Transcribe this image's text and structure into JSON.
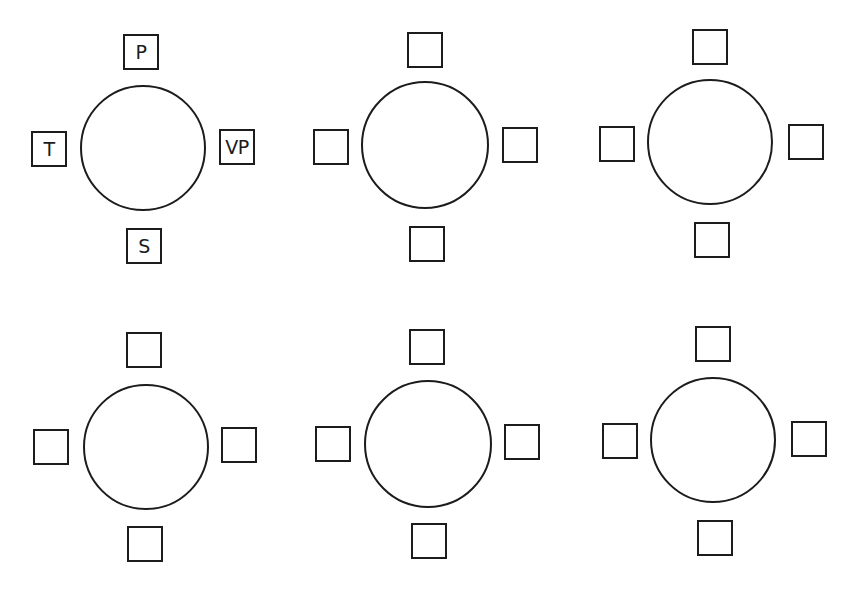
{
  "diagram": {
    "colors": {
      "stroke": "#1c1c1c",
      "background": "#ffffff"
    },
    "tables": [
      {
        "id": 1,
        "cx": 143,
        "cy": 148,
        "r": 63,
        "seats": {
          "top": {
            "label": "P",
            "x": 123,
            "y": 34
          },
          "left": {
            "label": "T",
            "x": 31,
            "y": 131
          },
          "right": {
            "label": "VP",
            "x": 219,
            "y": 129
          },
          "bottom": {
            "label": "S",
            "x": 126,
            "y": 228
          }
        }
      },
      {
        "id": 2,
        "cx": 425,
        "cy": 145,
        "r": 64,
        "seats": {
          "top": {
            "label": "",
            "x": 407,
            "y": 32
          },
          "left": {
            "label": "",
            "x": 313,
            "y": 129
          },
          "right": {
            "label": "",
            "x": 502,
            "y": 127
          },
          "bottom": {
            "label": "",
            "x": 409,
            "y": 226
          }
        }
      },
      {
        "id": 3,
        "cx": 710,
        "cy": 142,
        "r": 63,
        "seats": {
          "top": {
            "label": "",
            "x": 692,
            "y": 29
          },
          "left": {
            "label": "",
            "x": 599,
            "y": 126
          },
          "right": {
            "label": "",
            "x": 788,
            "y": 124
          },
          "bottom": {
            "label": "",
            "x": 694,
            "y": 222
          }
        }
      },
      {
        "id": 4,
        "cx": 146,
        "cy": 447,
        "r": 63,
        "seats": {
          "top": {
            "label": "",
            "x": 126,
            "y": 332
          },
          "left": {
            "label": "",
            "x": 33,
            "y": 429
          },
          "right": {
            "label": "",
            "x": 221,
            "y": 427
          },
          "bottom": {
            "label": "",
            "x": 127,
            "y": 526
          }
        }
      },
      {
        "id": 5,
        "cx": 428,
        "cy": 444,
        "r": 64,
        "seats": {
          "top": {
            "label": "",
            "x": 409,
            "y": 329
          },
          "left": {
            "label": "",
            "x": 315,
            "y": 426
          },
          "right": {
            "label": "",
            "x": 504,
            "y": 424
          },
          "bottom": {
            "label": "",
            "x": 411,
            "y": 523
          }
        }
      },
      {
        "id": 6,
        "cx": 713,
        "cy": 440,
        "r": 63,
        "seats": {
          "top": {
            "label": "",
            "x": 695,
            "y": 326
          },
          "left": {
            "label": "",
            "x": 602,
            "y": 423
          },
          "right": {
            "label": "",
            "x": 791,
            "y": 421
          },
          "bottom": {
            "label": "",
            "x": 697,
            "y": 520
          }
        }
      }
    ]
  }
}
